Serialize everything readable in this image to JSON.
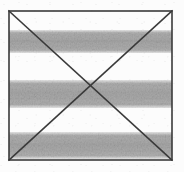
{
  "figure": {
    "caption": "",
    "canvas": {
      "width": 184,
      "height": 172
    },
    "background_color": "#fcfcfc",
    "frame": {
      "name": "outer-rectangle",
      "x": 9,
      "y": 11,
      "width": 163,
      "height": 149,
      "stroke_color": "#3a3a3a",
      "stroke_width": 1.6,
      "fill": "none"
    },
    "diagonals": {
      "stroke_color": "#3a3a3a",
      "stroke_width": 1.6,
      "intersection": {
        "x": 90.5,
        "y": 85.5
      },
      "lines": [
        {
          "name": "diagonal-top-left-to-bottom-right",
          "x1": 9,
          "y1": 11,
          "x2": 172,
          "y2": 160
        },
        {
          "name": "diagonal-top-right-to-bottom-left",
          "x1": 172,
          "y1": 11,
          "x2": 9,
          "y2": 160
        }
      ]
    },
    "stripes": {
      "fill_color": "#aeaeae",
      "edge_softness_px": 3,
      "count": 3,
      "bands": [
        {
          "name": "stripe-band-1",
          "y": 30,
          "height": 23,
          "label": "top band"
        },
        {
          "name": "stripe-band-2",
          "y": 80,
          "height": 28,
          "label": "middle band"
        },
        {
          "name": "stripe-band-3",
          "y": 132,
          "height": 27,
          "label": "bottom band"
        }
      ],
      "gaps": [
        {
          "name": "gap-1",
          "y": 11,
          "height": 19
        },
        {
          "name": "gap-2",
          "y": 53,
          "height": 27
        },
        {
          "name": "gap-3",
          "y": 108,
          "height": 24
        },
        {
          "name": "gap-4",
          "y": 159,
          "height": 1
        }
      ]
    }
  }
}
